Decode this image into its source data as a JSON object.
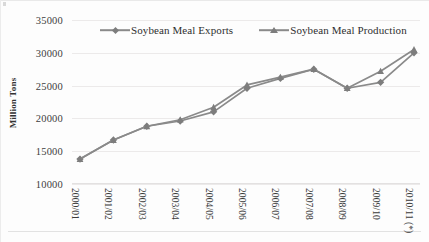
{
  "chart_data": {
    "type": "line",
    "title": "",
    "subtitle": "",
    "xlabel": "",
    "ylabel": "Million Tons",
    "ylim": [
      10000,
      35000
    ],
    "yticks": [
      "10000",
      "15000",
      "20000",
      "25000",
      "30000",
      "35000"
    ],
    "ytick_values": [
      10000,
      15000,
      20000,
      25000,
      30000,
      35000
    ],
    "grid": true,
    "legend_position": "top",
    "categories": [
      "2000/01",
      "2001/02",
      "2002/03",
      "2003/04",
      "2004/05",
      "2005/06",
      "2006/07",
      "2007/08",
      "2008/09",
      "2009/10",
      "2010/11 (*)"
    ],
    "series": [
      {
        "name": "Soybean Meal Exports",
        "marker": "diamond",
        "color": "#7d7d7d",
        "values": [
          13800,
          16700,
          18800,
          19600,
          21000,
          24600,
          26100,
          27500,
          24600,
          25500,
          30000
        ]
      },
      {
        "name": "Soybean Meal Production",
        "marker": "triangle",
        "color": "#7d7d7d",
        "values": [
          13800,
          16700,
          18800,
          19800,
          21700,
          25100,
          26300,
          27500,
          24600,
          27200,
          30500
        ]
      }
    ]
  },
  "colors": {
    "series_gray": "#7d7d7d",
    "line_gray": "#8a8a8a",
    "grid": "#eceaea",
    "text": "#3a3a3a",
    "background": "#fdfdfd"
  }
}
